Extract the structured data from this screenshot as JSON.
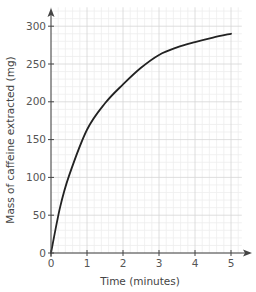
{
  "chart_data": {
    "type": "line",
    "title": "",
    "xlabel": "Time (minutes)",
    "ylabel": "Mass of caffeine extracted (mg)",
    "xlim": [
      0,
      5.3
    ],
    "ylim": [
      0,
      325
    ],
    "x_ticks": [
      0,
      1,
      2,
      3,
      4,
      5
    ],
    "y_ticks": [
      0,
      50,
      100,
      150,
      200,
      250,
      300
    ],
    "grid": {
      "on": true,
      "minor_x_step": 0.2,
      "minor_y_step": 10,
      "major_x_step": 1,
      "major_y_step": 50
    },
    "legend": null,
    "series": [
      {
        "name": "Caffeine extracted",
        "x": [
          0,
          0.25,
          0.5,
          1,
          1.5,
          2,
          2.5,
          3,
          3.5,
          4,
          4.5,
          5
        ],
        "y": [
          0,
          60,
          102,
          163,
          198,
          223,
          245,
          262,
          272,
          279,
          285,
          290
        ]
      }
    ]
  },
  "colors": {
    "curve": "#222222",
    "axis": "#444444",
    "grid_major": "#d6d6d6",
    "grid_minor": "#eeeeee"
  }
}
